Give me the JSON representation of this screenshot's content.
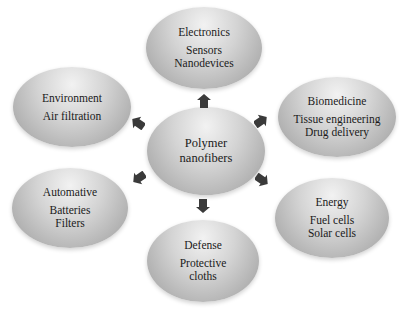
{
  "center": {
    "line1": "Polymer",
    "line2": "nanofibers"
  },
  "nodes": {
    "electronics": {
      "title": "Electronics",
      "items": [
        "Sensors",
        "Nanodevices"
      ]
    },
    "environment": {
      "title": "Environment",
      "items": [
        "Air filtration"
      ]
    },
    "biomedicine": {
      "title": "Biomedicine",
      "items": [
        "Tissue engineering",
        "Drug delivery"
      ]
    },
    "automative": {
      "title": "Automative",
      "items": [
        "Batteries",
        "Filters"
      ]
    },
    "energy": {
      "title": "Energy",
      "items": [
        "Fuel cells",
        "Solar cells"
      ]
    },
    "defense": {
      "title": "Defense",
      "items": [
        "Protective",
        "cloths"
      ]
    }
  },
  "colors": {
    "arrow": "#3a3a3a",
    "ellipse_light": "#f2f2f2",
    "ellipse_dark": "#9c9c9c"
  }
}
